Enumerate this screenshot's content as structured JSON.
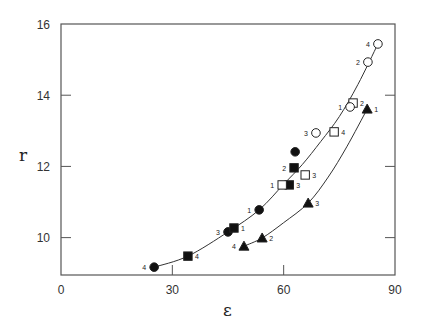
{
  "chart_data": {
    "type": "scatter",
    "title": "",
    "xlabel": "ε",
    "ylabel": "r",
    "xlim": [
      0,
      90
    ],
    "ylim": [
      8.95,
      16
    ],
    "xticks": [
      0,
      30,
      60,
      90
    ],
    "yticks": [
      10,
      12,
      14,
      16
    ],
    "grid": false,
    "legend": "none",
    "series": [
      {
        "name": "filled-circle",
        "marker": "circle",
        "filled": true,
        "points": [
          {
            "x": 25.1,
            "y": 9.17,
            "label": "4"
          },
          {
            "x": 45.0,
            "y": 10.16,
            "label": "3"
          },
          {
            "x": 53.4,
            "y": 10.78,
            "label": "1"
          },
          {
            "x": 63.1,
            "y": 12.41,
            "label": ""
          }
        ]
      },
      {
        "name": "filled-square",
        "marker": "square",
        "filled": true,
        "points": [
          {
            "x": 34.2,
            "y": 9.48,
            "label": "4"
          },
          {
            "x": 46.6,
            "y": 10.27,
            "label": "1"
          },
          {
            "x": 61.5,
            "y": 11.48,
            "label": "3"
          },
          {
            "x": 62.8,
            "y": 11.96,
            "label": "2"
          }
        ]
      },
      {
        "name": "open-square",
        "marker": "square",
        "filled": false,
        "points": [
          {
            "x": 59.6,
            "y": 11.48,
            "label": "1"
          },
          {
            "x": 65.8,
            "y": 11.76,
            "label": "3"
          },
          {
            "x": 73.6,
            "y": 12.97,
            "label": "4"
          },
          {
            "x": 78.7,
            "y": 13.78,
            "label": "2"
          }
        ]
      },
      {
        "name": "open-circle",
        "marker": "circle",
        "filled": false,
        "points": [
          {
            "x": 68.7,
            "y": 12.94,
            "label": "3"
          },
          {
            "x": 77.9,
            "y": 13.67,
            "label": "1"
          },
          {
            "x": 82.7,
            "y": 14.93,
            "label": "2"
          },
          {
            "x": 85.4,
            "y": 15.44,
            "label": "4"
          }
        ]
      },
      {
        "name": "filled-triangle",
        "marker": "triangle",
        "filled": true,
        "points": [
          {
            "x": 49.3,
            "y": 9.76,
            "label": "4"
          },
          {
            "x": 54.2,
            "y": 9.99,
            "label": "2"
          },
          {
            "x": 66.6,
            "y": 10.97,
            "label": "3"
          },
          {
            "x": 82.5,
            "y": 13.61,
            "label": "1"
          }
        ]
      }
    ],
    "curves": [
      {
        "name": "upper-fit",
        "x": [
          25.1,
          34.2,
          45.0,
          53.4,
          60.0,
          65.0,
          70.0,
          75.0,
          80.0,
          85.4
        ],
        "y": [
          9.17,
          9.48,
          10.16,
          10.78,
          11.5,
          12.05,
          12.7,
          13.4,
          14.3,
          15.44
        ]
      },
      {
        "name": "lower-fit",
        "x": [
          49.3,
          54.2,
          60.0,
          66.6,
          72.0,
          77.0,
          82.5
        ],
        "y": [
          9.76,
          9.99,
          10.42,
          10.97,
          11.7,
          12.55,
          13.61
        ]
      }
    ]
  },
  "axes": {
    "x_title": "ε",
    "y_title": "r",
    "x_tick_labels": [
      "0",
      "30",
      "60",
      "90"
    ],
    "y_tick_labels": [
      "10",
      "12",
      "14",
      "16"
    ]
  }
}
